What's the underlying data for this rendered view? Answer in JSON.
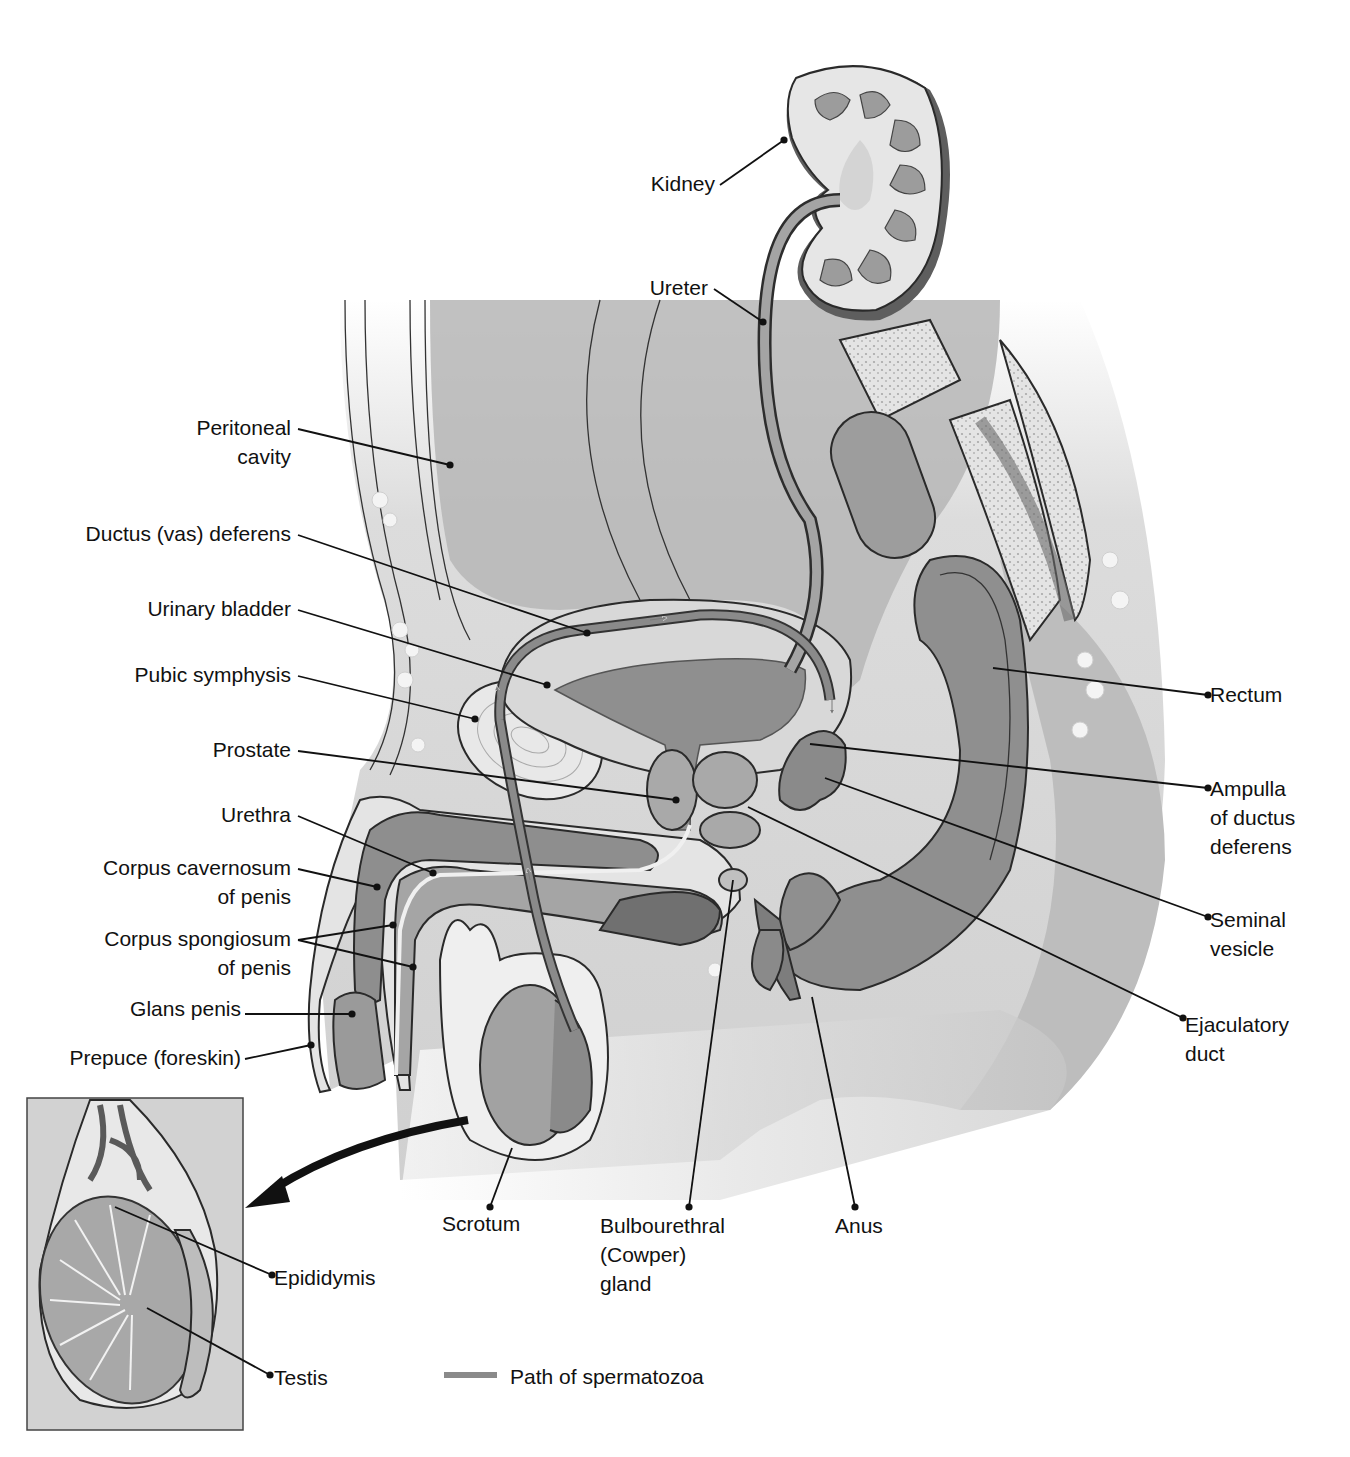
{
  "figure": {
    "legend": {
      "label": "Path of spermatozoa",
      "swatch_color": "#8a8a8a",
      "x1": 444,
      "y1": 1375,
      "x2": 497,
      "y2": 1375,
      "text_x": 510,
      "text_y": 1384
    },
    "colors": {
      "background": "#ffffff",
      "body_light": "#e6e6e6",
      "body_mid": "#c4c4c4",
      "organ_dark": "#8e8e8e",
      "organ_darker": "#6f6f6f",
      "path_gray": "#8a8a8a",
      "inset_bg": "#d6d6d6",
      "label_text": "#111111"
    },
    "labels": [
      {
        "id": "kidney",
        "lines": [
          "Kidney"
        ],
        "x": 715,
        "y": 191,
        "anchor": "end",
        "leader": [
          [
            720,
            185
          ],
          [
            784,
            140
          ]
        ]
      },
      {
        "id": "ureter",
        "lines": [
          "Ureter"
        ],
        "x": 708,
        "y": 295,
        "anchor": "end",
        "leader": [
          [
            714,
            289
          ],
          [
            763,
            322
          ]
        ]
      },
      {
        "id": "peritoneal-cavity",
        "lines": [
          "Peritoneal",
          "cavity"
        ],
        "x": 291,
        "y": 435,
        "anchor": "end",
        "leader": [
          [
            298,
            429
          ],
          [
            450,
            465
          ]
        ]
      },
      {
        "id": "ductus-deferens",
        "lines": [
          "Ductus (vas) deferens"
        ],
        "x": 291,
        "y": 541,
        "anchor": "end",
        "leader": [
          [
            298,
            535
          ],
          [
            587,
            633
          ]
        ]
      },
      {
        "id": "urinary-bladder",
        "lines": [
          "Urinary bladder"
        ],
        "x": 291,
        "y": 616,
        "anchor": "end",
        "leader": [
          [
            298,
            610
          ],
          [
            547,
            685
          ]
        ]
      },
      {
        "id": "pubic-symphysis",
        "lines": [
          "Pubic symphysis"
        ],
        "x": 291,
        "y": 682,
        "anchor": "end",
        "leader": [
          [
            298,
            676
          ],
          [
            475,
            719
          ]
        ]
      },
      {
        "id": "prostate",
        "lines": [
          "Prostate"
        ],
        "x": 291,
        "y": 757,
        "anchor": "end",
        "leader": [
          [
            298,
            751
          ],
          [
            676,
            800
          ]
        ]
      },
      {
        "id": "urethra",
        "lines": [
          "Urethra"
        ],
        "x": 291,
        "y": 822,
        "anchor": "end",
        "leader": [
          [
            298,
            816
          ],
          [
            433,
            873
          ]
        ]
      },
      {
        "id": "corpus-cavernosum",
        "lines": [
          "Corpus cavernosum",
          "of penis"
        ],
        "x": 291,
        "y": 875,
        "anchor": "end",
        "leader": [
          [
            298,
            869
          ],
          [
            377,
            887
          ]
        ]
      },
      {
        "id": "corpus-spongiosum",
        "lines": [
          "Corpus spongiosum",
          "of penis"
        ],
        "x": 291,
        "y": 946,
        "anchor": "end",
        "leader": [
          [
            298,
            940
          ],
          [
            393,
            925
          ]
        ],
        "leader2": [
          [
            298,
            940
          ],
          [
            413,
            967
          ]
        ]
      },
      {
        "id": "glans-penis",
        "lines": [
          "Glans penis"
        ],
        "x": 241,
        "y": 1016,
        "anchor": "end",
        "leader": [
          [
            245,
            1014
          ],
          [
            352,
            1014
          ]
        ]
      },
      {
        "id": "prepuce",
        "lines": [
          "Prepuce (foreskin)"
        ],
        "x": 241,
        "y": 1065,
        "anchor": "end",
        "leader": [
          [
            245,
            1059
          ],
          [
            311,
            1045
          ]
        ]
      },
      {
        "id": "rectum",
        "lines": [
          "Rectum"
        ],
        "x": 1210,
        "y": 702,
        "anchor": "start",
        "leader": [
          [
            993,
            668
          ],
          [
            1208,
            695
          ]
        ]
      },
      {
        "id": "ampulla",
        "lines": [
          "Ampulla",
          "of ductus",
          "deferens"
        ],
        "x": 1210,
        "y": 796,
        "anchor": "start",
        "leader": [
          [
            810,
            744
          ],
          [
            1208,
            788
          ]
        ]
      },
      {
        "id": "seminal-vesicle",
        "lines": [
          "Seminal",
          "vesicle"
        ],
        "x": 1210,
        "y": 927,
        "anchor": "start",
        "leader": [
          [
            825,
            778
          ],
          [
            1208,
            917
          ]
        ]
      },
      {
        "id": "ejaculatory-duct",
        "lines": [
          "Ejaculatory",
          "duct"
        ],
        "x": 1185,
        "y": 1032,
        "anchor": "start",
        "leader": [
          [
            748,
            807
          ],
          [
            1183,
            1018
          ]
        ]
      },
      {
        "id": "scrotum",
        "lines": [
          "Scrotum"
        ],
        "x": 442,
        "y": 1231,
        "anchor": "start",
        "leader": [
          [
            512,
            1148
          ],
          [
            490,
            1207
          ]
        ]
      },
      {
        "id": "bulbourethral-gland",
        "lines": [
          "Bulbourethral",
          "(Cowper)",
          "gland"
        ],
        "x": 600,
        "y": 1233,
        "anchor": "start",
        "leader": [
          [
            733,
            880
          ],
          [
            689,
            1207
          ]
        ]
      },
      {
        "id": "anus",
        "lines": [
          "Anus"
        ],
        "x": 835,
        "y": 1233,
        "anchor": "start",
        "leader": [
          [
            812,
            997
          ],
          [
            855,
            1207
          ]
        ]
      },
      {
        "id": "epididymis",
        "lines": [
          "Epididymis"
        ],
        "x": 274,
        "y": 1285,
        "anchor": "start",
        "leader": [
          [
            115,
            1207
          ],
          [
            272,
            1275
          ]
        ]
      },
      {
        "id": "testis",
        "lines": [
          "Testis"
        ],
        "x": 274,
        "y": 1385,
        "anchor": "start",
        "leader": [
          [
            147,
            1308
          ],
          [
            270,
            1375
          ]
        ]
      }
    ]
  }
}
